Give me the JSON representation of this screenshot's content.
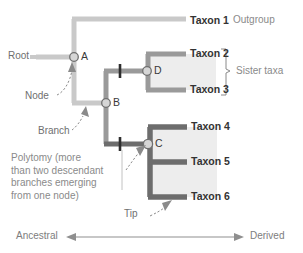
{
  "figure": {
    "background_color": "#ffffff"
  },
  "colors": {
    "branch_light": "#c9c9c9",
    "branch_medium": "#9a9a9a",
    "branch_dark": "#6d6d6d",
    "clade_shade": "#ededed",
    "node_fill": "#d6d6d6",
    "node_stroke": "#707070",
    "tick_mark": "#2e2e2e",
    "label_dark": "#333333",
    "label_gray": "#8a8a8a",
    "axis": "#8f8f8f"
  },
  "taxa": [
    {
      "id": "taxon1",
      "label": "Taxon 1",
      "y": 22
    },
    {
      "id": "taxon2",
      "label": "Taxon 2",
      "y": 54
    },
    {
      "id": "taxon3",
      "label": "Taxon 3",
      "y": 90
    },
    {
      "id": "taxon4",
      "label": "Taxon 4",
      "y": 127
    },
    {
      "id": "taxon5",
      "label": "Taxon 5",
      "y": 162
    },
    {
      "id": "taxon6",
      "label": "Taxon 6",
      "y": 197
    }
  ],
  "nodes": [
    {
      "id": "A",
      "label": "A",
      "x": 74,
      "y": 57
    },
    {
      "id": "B",
      "label": "B",
      "x": 106,
      "y": 103
    },
    {
      "id": "C",
      "label": "C",
      "x": 148,
      "y": 144
    },
    {
      "id": "D",
      "label": "D",
      "x": 147,
      "y": 71
    }
  ],
  "annotations": {
    "outgroup": "Outgroup",
    "sister_taxa": "Sister taxa",
    "root": "Root",
    "node": "Node",
    "branch": "Branch",
    "tip": "Tip",
    "polytomy_lines": [
      "Polytomy (more",
      "than two descendant",
      "branches emerging",
      "from one node)"
    ]
  },
  "axis": {
    "left_label": "Ancestral",
    "right_label": "Derived",
    "y": 237
  }
}
